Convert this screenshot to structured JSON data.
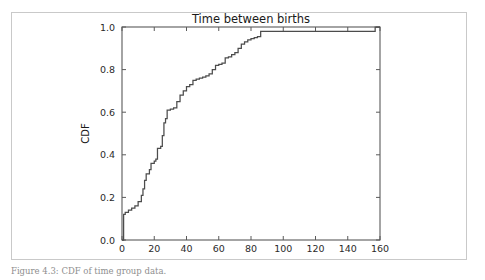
{
  "figure": {
    "caption": "Figure 4.3: CDF of time group data."
  },
  "chart_data": {
    "type": "line",
    "title": "Time between births",
    "xlabel": "minutes",
    "ylabel": "CDF",
    "xlim": [
      0,
      160
    ],
    "ylim": [
      0.0,
      1.0
    ],
    "xticks": [
      0,
      20,
      40,
      60,
      80,
      100,
      120,
      140,
      160
    ],
    "xtick_labels": [
      "0",
      "20",
      "40",
      "60",
      "80",
      "100",
      "120",
      "140",
      "160"
    ],
    "yticks": [
      0.0,
      0.2,
      0.4,
      0.6,
      0.8,
      1.0
    ],
    "ytick_labels": [
      "0.0",
      "0.2",
      "0.4",
      "0.6",
      "0.8",
      "1.0"
    ],
    "grid": false,
    "legend": null,
    "step_style": "post",
    "series": [
      {
        "name": "CDF of time between births",
        "color": "#4c4c4c",
        "x": [
          0,
          1,
          2,
          4,
          6,
          8,
          10,
          12,
          13,
          14,
          15,
          17,
          18,
          20,
          21,
          22,
          24,
          25,
          26,
          27,
          28,
          30,
          32,
          34,
          36,
          38,
          40,
          42,
          44,
          46,
          48,
          50,
          52,
          54,
          56,
          58,
          60,
          62,
          64,
          66,
          68,
          70,
          72,
          74,
          76,
          78,
          80,
          82,
          84,
          86,
          100,
          120,
          140,
          155,
          157
        ],
        "y": [
          0.0,
          0.12,
          0.13,
          0.14,
          0.15,
          0.16,
          0.18,
          0.21,
          0.24,
          0.28,
          0.31,
          0.33,
          0.36,
          0.37,
          0.38,
          0.43,
          0.44,
          0.49,
          0.55,
          0.57,
          0.61,
          0.615,
          0.62,
          0.65,
          0.68,
          0.7,
          0.72,
          0.73,
          0.75,
          0.755,
          0.76,
          0.765,
          0.77,
          0.78,
          0.8,
          0.82,
          0.825,
          0.83,
          0.855,
          0.86,
          0.87,
          0.88,
          0.9,
          0.92,
          0.93,
          0.94,
          0.945,
          0.95,
          0.955,
          0.98,
          0.98,
          0.98,
          0.98,
          0.98,
          1.0
        ]
      }
    ]
  }
}
